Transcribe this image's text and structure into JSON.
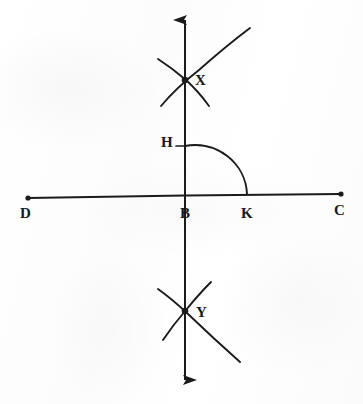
{
  "figure": {
    "ink_color": "#1b1b1b",
    "paper_color": "#fdfdfd",
    "labels": {
      "D": "D",
      "C": "C",
      "B": "B",
      "K": "K",
      "H": "H",
      "X": "X",
      "Y": "Y"
    },
    "label_positions": {
      "D": {
        "x": 20,
        "y": 206
      },
      "C": {
        "x": 334,
        "y": 203
      },
      "B": {
        "x": 180,
        "y": 206
      },
      "K": {
        "x": 241,
        "y": 206
      },
      "H": {
        "x": 161,
        "y": 135
      },
      "X": {
        "x": 195,
        "y": 73
      },
      "Y": {
        "x": 196,
        "y": 305
      }
    },
    "points": {
      "D": {
        "x": 28,
        "y": 198
      },
      "C": {
        "x": 341,
        "y": 194
      },
      "B": {
        "x": 185,
        "y": 196
      },
      "K": {
        "x": 247,
        "y": 195
      },
      "H": {
        "x": 185,
        "y": 146
      },
      "X": {
        "x": 185,
        "y": 79
      },
      "Y": {
        "x": 185,
        "y": 311
      }
    },
    "lines": {
      "horizontal_DC": {
        "x1": 28,
        "y1": 198,
        "x2": 341,
        "y2": 194,
        "endpoint_dots": true
      },
      "vertical_XY": {
        "x1": 185,
        "y1": 18,
        "x2": 185,
        "y2": 381,
        "arrow_top": true,
        "arrow_bottom": true
      }
    },
    "arcs": {
      "quarter_arc_HK": {
        "from": "H",
        "to": "K",
        "center": "B",
        "radius": 51
      },
      "arc_upper_long": {
        "note": "long arc through X sweeping up-right"
      },
      "arc_upper_short": {
        "note": "short arc through X sweeping down-right"
      },
      "arc_lower_long": {
        "note": "long arc through Y sweeping down-right"
      },
      "arc_lower_short": {
        "note": "short arc through Y sweeping down-left"
      }
    }
  }
}
